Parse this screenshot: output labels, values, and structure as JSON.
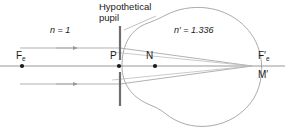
{
  "figure": {
    "type": "optical-ray-diagram",
    "background_color": "#ffffff",
    "line_color": "#9a9a9a",
    "axis_color": "#8c8c8c",
    "pupil_color": "#6e6e6e",
    "text_color": "#1a1a1a",
    "width": 285,
    "height": 133
  },
  "labels": {
    "pupil_title_line1": "Hypothetical",
    "pupil_title_line2": "pupil",
    "index_object_space": "n = 1",
    "index_object_space_symbol": "n",
    "index_object_space_value": "1",
    "index_image_space": "n′ = 1.336",
    "index_image_space_symbol": "n′",
    "index_image_space_value": "1.336",
    "front_focal_point": "F",
    "front_focal_subscript": "e",
    "pupil_point": "P",
    "nodal_point": "N",
    "rear_focal_point": "F",
    "rear_focal_subscript": "e",
    "rear_focal_prime": "′",
    "image_point": "M′"
  },
  "points": {
    "front_focal": {
      "x": 22,
      "y": 66
    },
    "pupil": {
      "x": 119,
      "y": 66
    },
    "nodal": {
      "x": 155,
      "y": 66
    },
    "rear_focal": {
      "x": 252,
      "y": 66
    }
  },
  "rays": {
    "incoming_upper_y": 48,
    "incoming_lower_y": 84,
    "incoming_start_x": 20,
    "arrowhead_x": 74
  },
  "pupil_plane": {
    "x": 120,
    "top_y": 26,
    "bottom_y": 106
  }
}
